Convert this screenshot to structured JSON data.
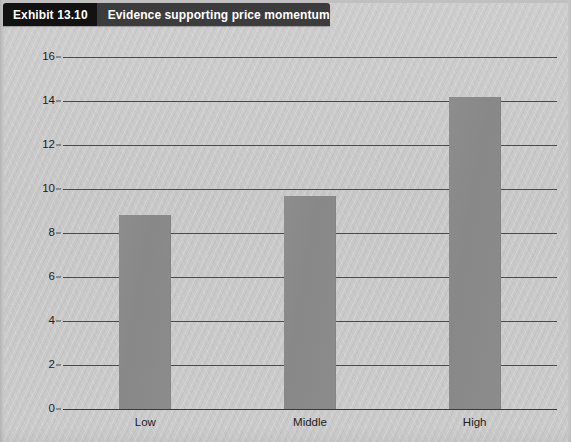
{
  "exhibit": {
    "number_label": "Exhibit 13.10",
    "title": "Evidence supporting price momentum"
  },
  "colors": {
    "header_number_bg": "#121212",
    "header_title_bg": "#3c3c3c",
    "header_text": "#ffffff",
    "background": "#c9c9c9",
    "bar_fill": "#8a8a8a",
    "gridline": "#4a4a4a",
    "axis_text": "#1d1d1d"
  },
  "chart_data": {
    "type": "bar",
    "title": "Evidence supporting price momentum",
    "xlabel": "",
    "ylabel": "",
    "categories": [
      "Low",
      "Middle",
      "High"
    ],
    "values": [
      8.8,
      9.7,
      14.2
    ],
    "ylim": [
      0,
      16
    ],
    "yticks": [
      0,
      2,
      4,
      6,
      8,
      10,
      12,
      14,
      16
    ],
    "ytick_labels": [
      "0",
      "2",
      "4",
      "6",
      "8",
      "10",
      "12",
      "14",
      "16"
    ],
    "grid": true,
    "grid_axis": "y",
    "legend": false,
    "series": [
      {
        "name": "",
        "values": [
          8.8,
          9.7,
          14.2
        ]
      }
    ]
  }
}
